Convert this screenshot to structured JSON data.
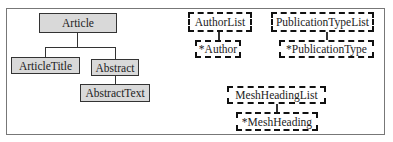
{
  "diagram": {
    "nodes": {
      "article": "Article",
      "article_title": "ArticleTitle",
      "abstract": "Abstract",
      "abstract_text": "AbstractText",
      "author_list": "AuthorList",
      "author": "*Author",
      "publication_type_list": "PublicationTypeList",
      "publication_type": "*PublicationType",
      "mesh_heading_list": "MeshHeadingList",
      "mesh_heading": "*MeshHeading"
    },
    "edges": [
      [
        "Article",
        "ArticleTitle"
      ],
      [
        "Article",
        "Abstract"
      ],
      [
        "Abstract",
        "AbstractText"
      ],
      [
        "AuthorList",
        "*Author"
      ],
      [
        "PublicationTypeList",
        "*PublicationType"
      ],
      [
        "MeshHeadingList",
        "*MeshHeading"
      ]
    ]
  }
}
